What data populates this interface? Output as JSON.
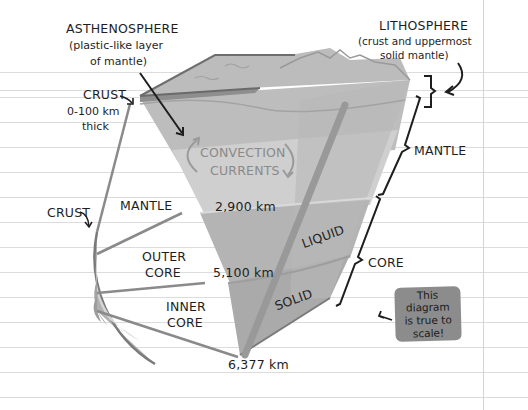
{
  "diagram": {
    "labels": {
      "asthenosphere": {
        "title": "ASTHENOSPHERE",
        "line1": "(plastic-like layer",
        "line2": "of mantle)"
      },
      "lithosphere": {
        "title": "LITHOSPHERE",
        "line1": "(crust and uppermost",
        "line2": "solid mantle)"
      },
      "crust_top": {
        "title": "CRUST",
        "line1": "0-100 km",
        "line2": "thick"
      },
      "crust_left": "CRUST",
      "convection": {
        "line1": "CONVECTION",
        "line2": "CURRENTS"
      },
      "mantle_left": "MANTLE",
      "mantle_right": "MANTLE",
      "outer_core": {
        "line1": "OUTER",
        "line2": "CORE"
      },
      "inner_core": {
        "line1": "INNER",
        "line2": "CORE"
      },
      "liquid": "LIQUID",
      "solid": "SOLID",
      "core_right": "CORE",
      "depth_mantle": "2,900 km",
      "depth_outer_core": "5,100 km",
      "depth_center": "6,377 km"
    },
    "note": {
      "line1": "This diagram",
      "line2": "is true to",
      "line3": "scale!"
    },
    "colors": {
      "paper": "#ffffff",
      "rule_line": "#dcdcdc",
      "crust": "#a8a8a8",
      "lithosphere": "#bdbdbd",
      "mantle_upper": "#b3b3b3",
      "mantle_lower": "#c9c9c9",
      "outer_core": "#b0b0b0",
      "inner_core": "#a3a3a3",
      "outline": "#6e6e6e",
      "note_bg": "#8c8c8c",
      "ink": "#1e1e1e"
    }
  }
}
